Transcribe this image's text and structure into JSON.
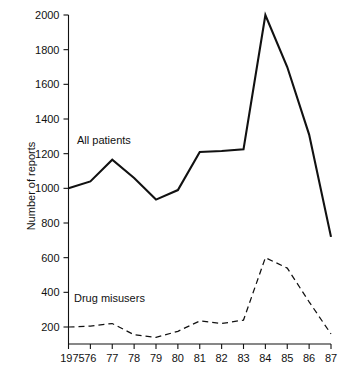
{
  "chart_data": {
    "type": "line",
    "title": "",
    "subtitle": "",
    "xlabel": "",
    "ylabel": "Number of reports",
    "x": [
      1975,
      1976,
      1977,
      1978,
      1979,
      1980,
      1981,
      1982,
      1983,
      1984,
      1985,
      1986,
      1987
    ],
    "xtick_labels": [
      "1975",
      "76",
      "77",
      "78",
      "79",
      "80",
      "81",
      "82",
      "83",
      "84",
      "85",
      "86",
      "87"
    ],
    "ytick_labels": [
      "200",
      "400",
      "600",
      "800",
      "1000",
      "1200",
      "1400",
      "1600",
      "1800",
      "2000"
    ],
    "ytick_values": [
      200,
      400,
      600,
      800,
      1000,
      1200,
      1400,
      1600,
      1800,
      2000
    ],
    "ylim": [
      0,
      2000
    ],
    "xlim": [
      1975,
      1987
    ],
    "grid": false,
    "legend_position": "inline-annotation",
    "series": [
      {
        "name": "All patients",
        "style": "solid",
        "color": "#111111",
        "values": [
          1000,
          1040,
          1165,
          1060,
          935,
          990,
          1210,
          1215,
          1225,
          2000,
          1700,
          1310,
          720
        ]
      },
      {
        "name": "Drug misusers",
        "style": "dashed",
        "color": "#111111",
        "values": [
          200,
          205,
          220,
          155,
          140,
          175,
          235,
          220,
          240,
          600,
          540,
          345,
          160
        ]
      }
    ],
    "annotations": [
      {
        "text": "All patients",
        "series": "All patients"
      },
      {
        "text": "Drug misusers",
        "series": "Drug misusers"
      }
    ]
  }
}
